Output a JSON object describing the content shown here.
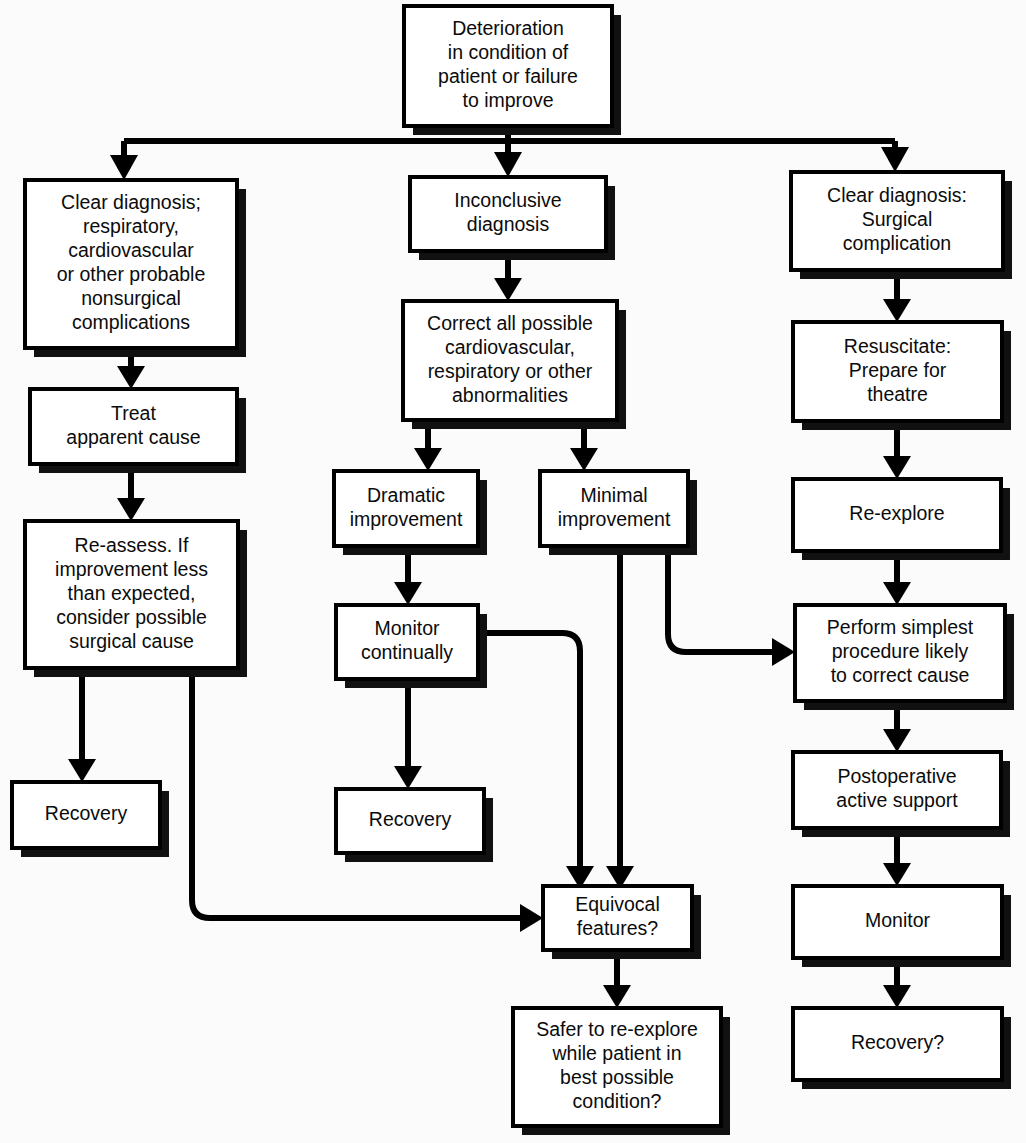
{
  "diagram": {
    "type": "flowchart",
    "background_color": "#fbfbfb",
    "box_fill": "#ffffff",
    "line_color": "#000000",
    "text_color": "#0b0b0b"
  },
  "nodes": {
    "root": {
      "id": "root",
      "lines": [
        "Deterioration",
        "in condition of",
        "patient or failure",
        "to improve"
      ],
      "x": 404,
      "y": 6,
      "w": 208,
      "h": 120
    },
    "clear_nonsurgical": {
      "id": "clear_nonsurgical",
      "lines": [
        "Clear diagnosis;",
        "respiratory,",
        "cardiovascular",
        "or other probable",
        "nonsurgical",
        "complications"
      ],
      "x": 25,
      "y": 180,
      "w": 212,
      "h": 168
    },
    "treat_cause": {
      "id": "treat_cause",
      "lines": [
        "Treat",
        "apparent cause"
      ],
      "x": 30,
      "y": 389,
      "w": 207,
      "h": 75
    },
    "reassess": {
      "id": "reassess",
      "lines": [
        "Re-assess. If",
        "improvement less",
        "than expected,",
        "consider possible",
        "surgical cause"
      ],
      "x": 25,
      "y": 521,
      "w": 213,
      "h": 147
    },
    "recovery_left": {
      "id": "recovery_left",
      "lines": [
        "Recovery"
      ],
      "x": 12,
      "y": 782,
      "w": 148,
      "h": 66
    },
    "inconclusive": {
      "id": "inconclusive",
      "lines": [
        "Inconclusive",
        "diagnosis"
      ],
      "x": 410,
      "y": 177,
      "w": 196,
      "h": 74
    },
    "correct_all": {
      "id": "correct_all",
      "lines": [
        "Correct all possible",
        "cardiovascular,",
        "respiratory or other",
        "abnormalities"
      ],
      "x": 403,
      "y": 301,
      "w": 214,
      "h": 119
    },
    "dramatic": {
      "id": "dramatic",
      "lines": [
        "Dramatic",
        "improvement"
      ],
      "x": 334,
      "y": 471,
      "w": 144,
      "h": 75
    },
    "minimal": {
      "id": "minimal",
      "lines": [
        "Minimal",
        "improvement"
      ],
      "x": 540,
      "y": 471,
      "w": 148,
      "h": 75
    },
    "monitor_continually": {
      "id": "monitor_continually",
      "lines": [
        "Monitor",
        "continually"
      ],
      "x": 336,
      "y": 605,
      "w": 142,
      "h": 74
    },
    "recovery_mid": {
      "id": "recovery_mid",
      "lines": [
        "Recovery"
      ],
      "x": 336,
      "y": 789,
      "w": 148,
      "h": 64
    },
    "equivocal": {
      "id": "equivocal",
      "lines": [
        "Equivocal",
        "features?"
      ],
      "x": 543,
      "y": 886,
      "w": 149,
      "h": 64
    },
    "safer": {
      "id": "safer",
      "lines": [
        "Safer to re-explore",
        "while patient in",
        "best possible",
        "condition?"
      ],
      "x": 513,
      "y": 1008,
      "w": 208,
      "h": 118
    },
    "clear_surgical": {
      "id": "clear_surgical",
      "lines": [
        "Clear diagnosis:",
        "Surgical",
        "complication"
      ],
      "x": 791,
      "y": 172,
      "w": 212,
      "h": 98
    },
    "resuscitate": {
      "id": "resuscitate",
      "lines": [
        "Resuscitate:",
        "Prepare for",
        "theatre"
      ],
      "x": 793,
      "y": 322,
      "w": 209,
      "h": 99
    },
    "reexplore": {
      "id": "reexplore",
      "lines": [
        "Re-explore"
      ],
      "x": 793,
      "y": 479,
      "w": 208,
      "h": 72
    },
    "perform_simplest": {
      "id": "perform_simplest",
      "lines": [
        "Perform simplest",
        "procedure likely",
        "to correct cause"
      ],
      "x": 795,
      "y": 605,
      "w": 210,
      "h": 96
    },
    "postoperative": {
      "id": "postoperative",
      "lines": [
        "Postoperative",
        "active support"
      ],
      "x": 793,
      "y": 752,
      "w": 208,
      "h": 76
    },
    "monitor_right": {
      "id": "monitor_right",
      "lines": [
        "Monitor"
      ],
      "x": 793,
      "y": 886,
      "w": 209,
      "h": 72
    },
    "recovery_right": {
      "id": "recovery_right",
      "lines": [
        "Recovery?"
      ],
      "x": 793,
      "y": 1008,
      "w": 209,
      "h": 72
    }
  },
  "edges": [
    {
      "from": "root",
      "to": "clear_nonsurgical",
      "style": "bus-left"
    },
    {
      "from": "root",
      "to": "inconclusive",
      "style": "bus-center"
    },
    {
      "from": "root",
      "to": "clear_surgical",
      "style": "bus-right"
    },
    {
      "from": "clear_nonsurgical",
      "to": "treat_cause",
      "style": "straight-down"
    },
    {
      "from": "treat_cause",
      "to": "reassess",
      "style": "straight-down"
    },
    {
      "from": "reassess",
      "to": "recovery_left",
      "style": "straight-down"
    },
    {
      "from": "reassess",
      "to": "equivocal",
      "style": "down-right-elbow"
    },
    {
      "from": "inconclusive",
      "to": "correct_all",
      "style": "straight-down"
    },
    {
      "from": "correct_all",
      "to": "dramatic",
      "style": "split-left"
    },
    {
      "from": "correct_all",
      "to": "minimal",
      "style": "split-right"
    },
    {
      "from": "dramatic",
      "to": "monitor_continually",
      "style": "straight-down"
    },
    {
      "from": "monitor_continually",
      "to": "recovery_mid",
      "style": "straight-down"
    },
    {
      "from": "monitor_continually",
      "to": "equivocal",
      "style": "right-down-elbow"
    },
    {
      "from": "minimal",
      "to": "equivocal",
      "style": "straight-down"
    },
    {
      "from": "minimal",
      "to": "perform_simplest",
      "style": "down-right-into-left"
    },
    {
      "from": "equivocal",
      "to": "safer",
      "style": "straight-down"
    },
    {
      "from": "clear_surgical",
      "to": "resuscitate",
      "style": "straight-down"
    },
    {
      "from": "resuscitate",
      "to": "reexplore",
      "style": "straight-down"
    },
    {
      "from": "reexplore",
      "to": "perform_simplest",
      "style": "straight-down"
    },
    {
      "from": "perform_simplest",
      "to": "postoperative",
      "style": "straight-down"
    },
    {
      "from": "postoperative",
      "to": "monitor_right",
      "style": "straight-down"
    },
    {
      "from": "monitor_right",
      "to": "recovery_right",
      "style": "straight-down"
    }
  ]
}
